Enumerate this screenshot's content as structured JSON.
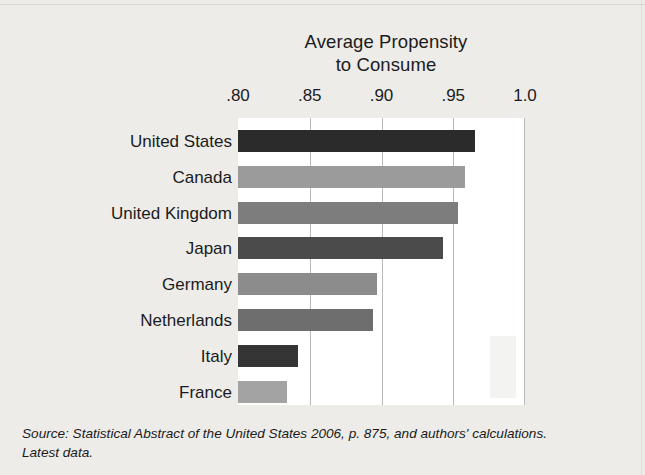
{
  "chart_data": {
    "type": "bar",
    "orientation": "horizontal",
    "title": "Average Propensity to Consume",
    "title_lines": [
      "Average Propensity",
      "to Consume"
    ],
    "xlabel": "",
    "ylabel": "",
    "xlim": [
      0.8,
      1.0
    ],
    "grid": true,
    "legend": "none",
    "tick_labels": [
      ".80",
      ".85",
      ".90",
      ".95",
      "1.0"
    ],
    "tick_values": [
      0.8,
      0.85,
      0.9,
      0.95,
      1.0
    ],
    "categories": [
      "United States",
      "Canada",
      "United Kingdom",
      "Japan",
      "Germany",
      "Netherlands",
      "Italy",
      "France"
    ],
    "values": [
      0.965,
      0.958,
      0.953,
      0.943,
      0.897,
      0.894,
      0.842,
      0.834
    ],
    "bar_colors": [
      "#2b2b2b",
      "#9b9b9b",
      "#7d7d7d",
      "#4b4b4b",
      "#8c8c8c",
      "#6e6e6e",
      "#353535",
      "#a3a3a3"
    ]
  },
  "source": {
    "lines": [
      "Source: Statistical Abstract of the United States 2006, p. 875, and authors' calculations.",
      "Latest data."
    ]
  },
  "colors": {
    "page_background": "#edece9",
    "plot_background": "#ffffff",
    "gridline": "#b9b9b6",
    "text": "#1b1b1b"
  }
}
